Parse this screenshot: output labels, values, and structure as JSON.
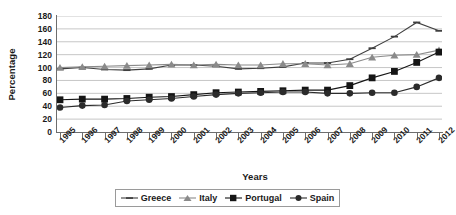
{
  "chart_data": {
    "type": "line",
    "title": "",
    "xlabel": "Years",
    "ylabel": "Percentage",
    "ylim": [
      0,
      180
    ],
    "ytick_step": 20,
    "yticks": [
      0,
      20,
      40,
      60,
      80,
      100,
      120,
      140,
      160,
      180
    ],
    "grid": true,
    "legend_position": "bottom",
    "categories": [
      "1995",
      "1996",
      "1997",
      "1998",
      "1999",
      "2000",
      "2001",
      "2002",
      "2003",
      "2004",
      "2005",
      "2006",
      "2007",
      "2008",
      "2009",
      "2010",
      "2011",
      "2012"
    ],
    "series": [
      {
        "name": "Greece",
        "marker": "dash",
        "color": "#3f3f3f",
        "values": [
          98,
          100,
          97,
          96,
          98,
          104,
          104,
          102,
          98,
          99,
          101,
          107,
          107,
          113,
          130,
          148,
          170,
          157
        ]
      },
      {
        "name": "Italy",
        "marker": "triangle",
        "color": "#8a8a8a",
        "values": [
          100,
          101,
          102,
          103,
          104,
          105,
          104,
          105,
          104,
          104,
          106,
          106,
          104,
          106,
          116,
          119,
          120,
          127
        ]
      },
      {
        "name": "Portugal",
        "marker": "square",
        "color": "#151515",
        "values": [
          50,
          51,
          51,
          52,
          54,
          55,
          58,
          61,
          62,
          63,
          64,
          65,
          65,
          72,
          84,
          94,
          108,
          124
        ]
      },
      {
        "name": "Spain",
        "marker": "circle",
        "color": "#2b2b2b",
        "values": [
          38,
          41,
          42,
          48,
          50,
          52,
          55,
          58,
          60,
          61,
          62,
          62,
          60,
          60,
          61,
          61,
          70,
          84
        ]
      }
    ]
  },
  "legend": {
    "items": [
      {
        "label": "Greece"
      },
      {
        "label": "Italy"
      },
      {
        "label": "Portugal"
      },
      {
        "label": "Spain"
      }
    ]
  }
}
